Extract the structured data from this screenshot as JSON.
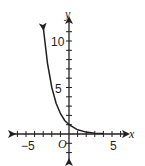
{
  "chart_data": {
    "type": "line",
    "title": "",
    "xlabel": "x",
    "ylabel": "y",
    "origin_label": "O",
    "x_tick_labels": [
      "-5",
      "5"
    ],
    "y_tick_labels": [
      "5",
      "10"
    ],
    "xlim": [
      -7,
      7
    ],
    "ylim": [
      -3,
      12
    ],
    "grid": false,
    "series": [
      {
        "name": "exponential decay curve",
        "x": [
          -3,
          -2.5,
          -2,
          -1.5,
          -1,
          -0.5,
          0,
          1,
          2,
          3,
          4
        ],
        "y": [
          11.5,
          7.6,
          5,
          3.3,
          2.2,
          1.45,
          1,
          0.45,
          0.2,
          0.09,
          0.04
        ]
      }
    ],
    "annotations": [
      "curve passes through (0, 1)",
      "arrow on left end pointing up",
      "approaches x-axis as x increases"
    ]
  },
  "labels": {
    "x_axis": "x",
    "y_axis": "y",
    "origin": "O",
    "x_neg5": "−5",
    "x_pos5": "5",
    "y5": "5",
    "y10": "10"
  },
  "colors": {
    "stroke": "#231f20"
  }
}
